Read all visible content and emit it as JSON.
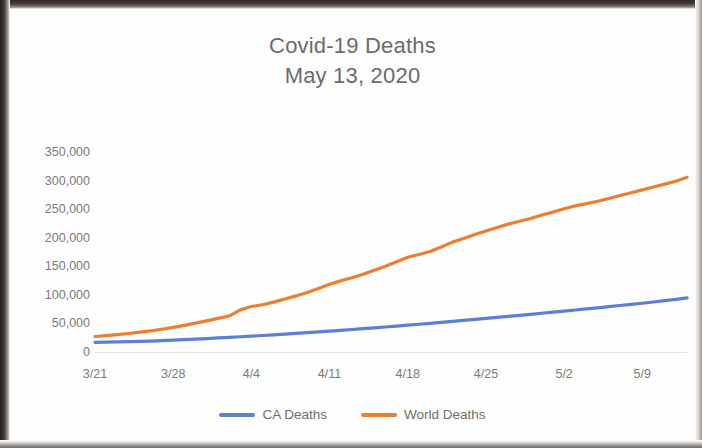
{
  "chart_data": {
    "type": "line",
    "title": "Covid-19 Deaths",
    "subtitle": "May 13, 2020",
    "xlabel": "",
    "ylabel": "",
    "ylim": [
      0,
      350000
    ],
    "ytick_labels": [
      "350,000",
      "300,000",
      "250,000",
      "200,000",
      "150,000",
      "100,000",
      "50,000",
      "0"
    ],
    "ytick_values": [
      350000,
      300000,
      250000,
      200000,
      150000,
      100000,
      50000,
      0
    ],
    "xtick_labels": [
      "3/21",
      "3/28",
      "4/4",
      "4/11",
      "4/18",
      "4/25",
      "5/2",
      "5/9"
    ],
    "grid": false,
    "legend_position": "bottom",
    "x": [
      "3/21",
      "3/22",
      "3/23",
      "3/24",
      "3/25",
      "3/26",
      "3/27",
      "3/28",
      "3/29",
      "3/30",
      "3/31",
      "4/1",
      "4/2",
      "4/3",
      "4/4",
      "4/5",
      "4/6",
      "4/7",
      "4/8",
      "4/9",
      "4/10",
      "4/11",
      "4/12",
      "4/13",
      "4/14",
      "4/15",
      "4/16",
      "4/17",
      "4/18",
      "4/19",
      "4/20",
      "4/21",
      "4/22",
      "4/23",
      "4/24",
      "4/25",
      "4/26",
      "4/27",
      "4/28",
      "4/29",
      "4/30",
      "5/1",
      "5/2",
      "5/3",
      "5/4",
      "5/5",
      "5/6",
      "5/7",
      "5/8",
      "5/9",
      "5/10",
      "5/11",
      "5/12",
      "5/13"
    ],
    "series": [
      {
        "name": "CA Deaths",
        "color": "#5B7FD4",
        "values": [
          1200,
          1500,
          1900,
          2300,
          2800,
          3400,
          4100,
          4900,
          5800,
          6800,
          7800,
          8800,
          9800,
          10900,
          12000,
          13100,
          14200,
          15400,
          16700,
          18000,
          19400,
          20800,
          22200,
          23600,
          25000,
          26500,
          28000,
          29600,
          31200,
          32800,
          34400,
          36100,
          37800,
          39500,
          41200,
          43000,
          44800,
          46600,
          48400,
          50200,
          52100,
          54000,
          55900,
          57800,
          59700,
          61600,
          63600,
          65600,
          67600,
          69600,
          71800,
          74000,
          76400,
          79000
        ]
      },
      {
        "name": "World Deaths",
        "color": "#ED7D31",
        "values": [
          11400,
          13000,
          14700,
          16600,
          18900,
          21300,
          24100,
          27300,
          30900,
          34800,
          38700,
          43000,
          47200,
          58000,
          63900,
          67000,
          71600,
          77000,
          82400,
          88500,
          95500,
          102600,
          108900,
          114200,
          120400,
          127400,
          134200,
          142000,
          150000,
          155000,
          160000,
          168000,
          176500,
          183000,
          190000,
          196000,
          202000,
          208000,
          213000,
          218000,
          224000,
          229000,
          235000,
          240000,
          244000,
          248000,
          253000,
          258000,
          263000,
          268000,
          273000,
          278000,
          283000,
          290000
        ]
      }
    ]
  },
  "legend": {
    "items": [
      {
        "label": "CA Deaths",
        "color": "#5B7FD4"
      },
      {
        "label": "World Deaths",
        "color": "#ED7D31"
      }
    ]
  }
}
